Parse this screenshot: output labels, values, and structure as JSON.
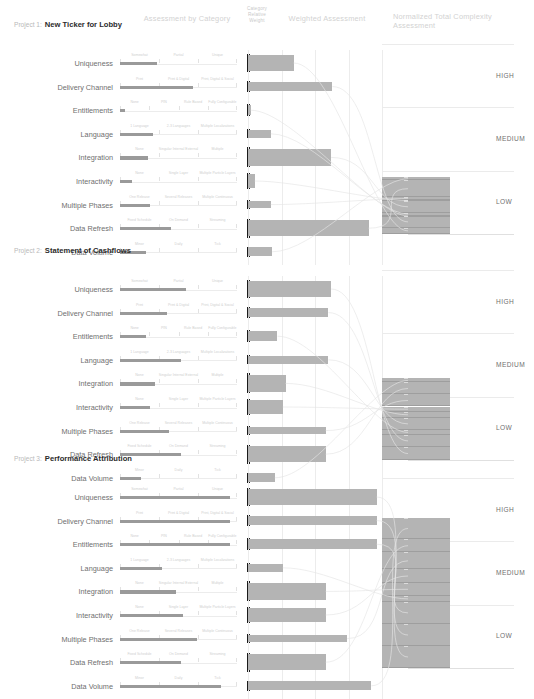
{
  "headers": {
    "assessment_by_category": "Assessment by Category",
    "category_relative_weight": "Category Relative Weight",
    "weighted_assessment": "Weighted Assessment",
    "normalized_total": "Normalized Total Complexity Assessment"
  },
  "bands": {
    "high": "HIGH",
    "medium": "MEDIUM",
    "low": "LOW"
  },
  "categories": [
    "Uniqueness",
    "Delivery Channel",
    "Entitlements",
    "Language",
    "Integration",
    "Interactivity",
    "Multiple Phases",
    "Data Refresh",
    "Data Volume"
  ],
  "scale_labels": [
    [
      "Somewhat",
      "Partial",
      "Unique"
    ],
    [
      "Print",
      "Print & Digital",
      "Print, Digital & Social"
    ],
    [
      "None",
      "PIN",
      "Rule Based",
      "Fully Configurable"
    ],
    [
      "1 Language",
      "2-3 Languages",
      "Multiple Localizations"
    ],
    [
      "None",
      "Singular Internal External",
      "Multiple"
    ],
    [
      "None",
      "Single Layer",
      "Multiple Particle Layers"
    ],
    [
      "One Release",
      "Several Releases",
      "Multiple Continuous"
    ],
    [
      "Fixed Schedule",
      "On Demand",
      "Streaming"
    ],
    [
      "Minor",
      "Daily",
      "Tick"
    ]
  ],
  "projects": [
    {
      "label": "Project 1:",
      "name": "New Ticker for Lobby",
      "category_scores": [
        0.32,
        0.62,
        0.04,
        0.28,
        0.24,
        0.1,
        0.26,
        0.44,
        0.22
      ],
      "weights": [
        0.92,
        0.46,
        0.52,
        0.36,
        1.0,
        0.72,
        0.34,
        0.96,
        0.4
      ],
      "weighted": [
        0.34,
        0.63,
        0.02,
        0.17,
        0.62,
        0.05,
        0.17,
        0.9,
        0.18
      ],
      "total_label": "LOW",
      "total_normalized": 0.3
    },
    {
      "label": "Project 2:",
      "name": "Statement of Cashflows",
      "category_scores": [
        0.56,
        0.4,
        0.22,
        0.52,
        0.3,
        0.26,
        0.42,
        0.52,
        0.18
      ],
      "weights": [
        0.92,
        0.46,
        0.52,
        0.36,
        1.0,
        0.72,
        0.34,
        0.96,
        0.4
      ],
      "weighted": [
        0.62,
        0.6,
        0.22,
        0.6,
        0.28,
        0.26,
        0.58,
        0.58,
        0.2
      ],
      "total_label": "LOW",
      "total_normalized": 0.43
    },
    {
      "label": "Project 3:",
      "name": "Performance Attribution",
      "category_scores": [
        0.94,
        0.94,
        0.94,
        0.36,
        0.48,
        0.54,
        0.66,
        0.52,
        0.86
      ],
      "weights": [
        0.92,
        0.46,
        0.52,
        0.36,
        1.0,
        0.72,
        0.34,
        0.96,
        0.4
      ],
      "weighted": [
        0.96,
        0.96,
        0.96,
        0.26,
        0.58,
        0.58,
        0.74,
        0.58,
        0.92
      ],
      "total_label": "MEDIUM",
      "total_normalized": 0.79
    }
  ],
  "colors": {
    "bar": "#b4b4b4",
    "cat_bar": "#9a9a9a",
    "weight_bar": "#1b1b1b",
    "grid": "#ececec",
    "text": "#6f6f6f",
    "header_text": "#d2d2d2",
    "title": "#2b2b2b"
  }
}
